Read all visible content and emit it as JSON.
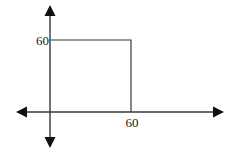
{
  "diagram": {
    "type": "coordinate-axes-with-square",
    "y_label": "60",
    "x_label": "60",
    "square": {
      "x0": 0,
      "y0": 0,
      "x1": 60,
      "y1": 60
    },
    "colors": {
      "line": "#3a3a3a",
      "arrow": "#111111",
      "background": "#ffffff"
    }
  }
}
